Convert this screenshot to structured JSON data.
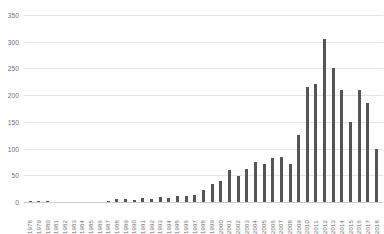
{
  "chart_data": {
    "type": "bar",
    "title": "",
    "subtitle": "",
    "xlabel": "",
    "ylabel": "",
    "ylim": [
      0,
      350
    ],
    "yticks": [
      0,
      50,
      100,
      150,
      200,
      250,
      300,
      350
    ],
    "grid": true,
    "legend": null,
    "bar_color": "#555555",
    "grid_color": "#e4e4e4",
    "tick_label_color": "#6e6e6e",
    "categories": [
      "1978",
      "1979",
      "1980",
      "1981",
      "1982",
      "1983",
      "1984",
      "1985",
      "1986",
      "1987",
      "1988",
      "1989",
      "1990",
      "1991",
      "1992",
      "1993",
      "1994",
      "1995",
      "1996",
      "1997",
      "1998",
      "1999",
      "2000",
      "2001",
      "2002",
      "2003",
      "2004",
      "2005",
      "2006",
      "2007",
      "2008",
      "2009",
      "2010",
      "2011",
      "2012",
      "2013",
      "2014",
      "2015",
      "2016",
      "2017",
      "2018"
    ],
    "values": [
      2,
      1,
      1,
      0,
      0,
      0,
      0,
      0,
      0,
      1,
      6,
      5,
      4,
      8,
      5,
      10,
      8,
      11,
      12,
      13,
      22,
      33,
      40,
      60,
      48,
      62,
      74,
      72,
      82,
      84,
      72,
      125,
      215,
      220,
      305,
      250,
      210,
      150,
      210,
      185,
      100
    ]
  }
}
